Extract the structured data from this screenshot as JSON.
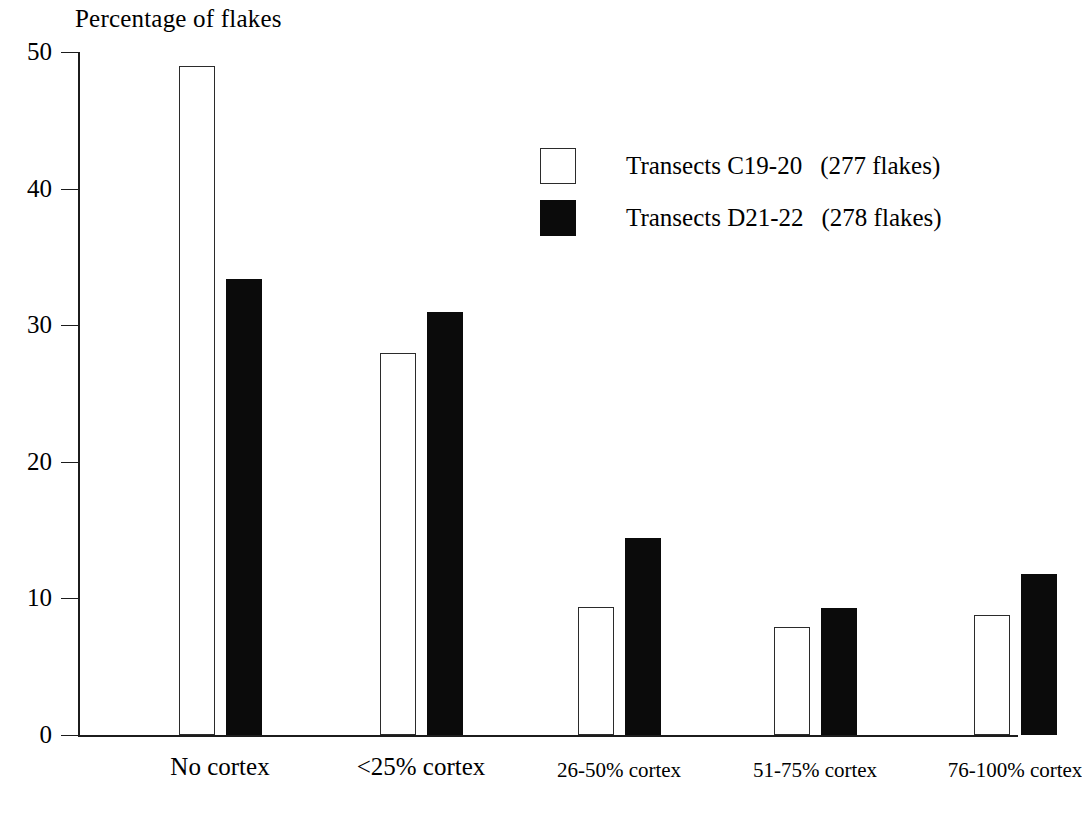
{
  "chart_data": {
    "type": "bar",
    "title": "Percentage of flakes",
    "xlabel": "",
    "ylabel": "",
    "ylim": [
      0,
      50
    ],
    "yticks": [
      0,
      10,
      20,
      30,
      40,
      50
    ],
    "ytick_labels": [
      "0",
      "10",
      "20",
      "30",
      "40",
      "50"
    ],
    "grid": false,
    "legend_position": "upper right",
    "categories": [
      "No cortex",
      "<25% cortex",
      "26-50% cortex",
      "51-75% cortex",
      "76-100% cortex"
    ],
    "series": [
      {
        "name": "Transects C19-20",
        "legend_label": "Transects C19-20",
        "count_label": "(277 flakes)",
        "style": "open",
        "color": "#ffffff",
        "edge_color": "#2b2b2b",
        "values": [
          49.0,
          28.0,
          9.4,
          7.9,
          8.8
        ]
      },
      {
        "name": "Transects D21-22",
        "legend_label": "Transects D21-22",
        "count_label": "(278 flakes)",
        "style": "filled",
        "color": "#0b0b0b",
        "edge_color": "#0b0b0b",
        "values": [
          33.4,
          31.0,
          14.4,
          9.3,
          11.8
        ]
      }
    ]
  }
}
